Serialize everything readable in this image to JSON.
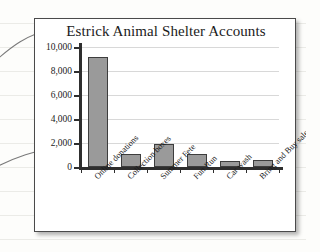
{
  "chart_data": {
    "type": "bar",
    "title": "Estrick Animal Shelter Accounts",
    "xlabel": "",
    "ylabel": "",
    "categories": [
      "Online donations",
      "Collection boxes",
      "Summer Fete",
      "Fun Run",
      "Car wash",
      "Bring and Buy sale"
    ],
    "values": [
      9200,
      1100,
      1950,
      1100,
      500,
      550
    ],
    "ylim": [
      0,
      10000
    ],
    "yticks": [
      0,
      2000,
      4000,
      6000,
      8000,
      10000
    ],
    "ytick_labels": [
      "0",
      "2,000",
      "4,000",
      "6,000",
      "8,000",
      "10,000"
    ],
    "grid": true,
    "legend": false,
    "bar_color": "#9a9a9a",
    "bar_edge_color": "#3d3d3d",
    "axis_color": "#2e2e2e",
    "gridline_color": "#d8d8d8"
  },
  "annotations": {
    "leader_line_top": "leader line pointing to chart title",
    "leader_line_bottom": "leader line pointing to y-axis origin"
  }
}
